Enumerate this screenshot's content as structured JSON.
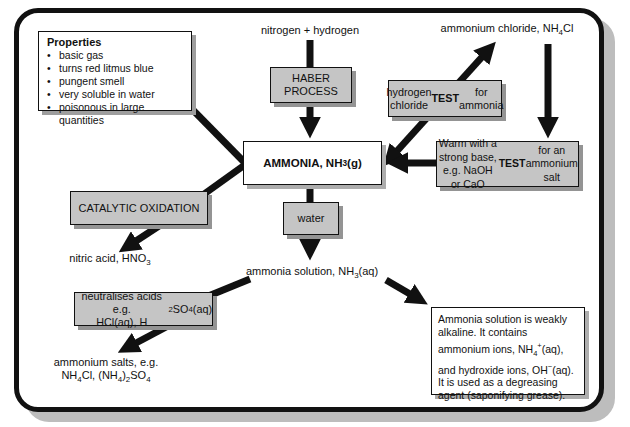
{
  "colors": {
    "box_gray": "#c5c5c5",
    "box_shadow_gray": "#949494",
    "frame_shadow": "#bdbdbd",
    "arrow_black": "#111111"
  },
  "nodes": {
    "properties": {
      "title": "Properties",
      "bullet": "•",
      "items": [
        "basic gas",
        "turns red litmus blue",
        "pungent smell",
        "very soluble in water",
        "poisonous in large quantities"
      ]
    },
    "nitrogen_hydrogen": "nitrogen + hydrogen",
    "haber_process": "HABER\nPROCESS",
    "ammonium_chloride": "ammonium chloride, NH~4~Cl",
    "hcl_test": "hydrogen chloride\n**TEST** for ammonia",
    "ammonia": "AMMONIA, NH~3~(g)",
    "warm_base": "Warm with a strong base,\ne.g. NaOH or CaO\n**TEST** for an ammonium salt",
    "catalytic_oxidation": "CATALYTIC OXIDATION",
    "water": "water",
    "nitric_acid": "nitric acid, HNO~3~",
    "ammonia_solution": "ammonia solution, NH~3~(aq)",
    "neutralises_acids": "neutralises acids e.g.\nHCl(aq), H~2~SO~4~(aq)",
    "ammonium_salts": "ammonium salts, e.g.\nNH~4~Cl, (NH~4~)~2~SO~4~",
    "solution_note": "Ammonia solution is weakly alkaline. It contains ammonium ions, NH~4~^+^(aq), and hydroxide ions, OH^−^(aq). It is used as a degreasing agent (saponifying grease)."
  }
}
